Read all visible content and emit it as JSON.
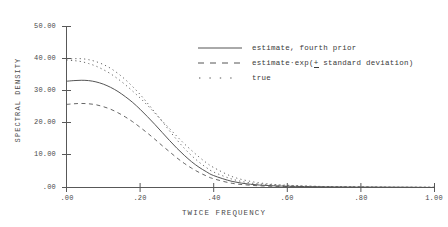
{
  "chart_data": {
    "type": "line",
    "title": "",
    "xlabel": "TWICE FREQUENCY",
    "ylabel": "SPECTRAL DENSITY",
    "xlim": [
      0.0,
      1.0
    ],
    "ylim": [
      0.0,
      50.0
    ],
    "xticks": [
      0.0,
      0.2,
      0.4,
      0.6,
      0.8,
      1.0
    ],
    "xtick_labels": [
      ".00",
      ".20",
      ".40",
      ".60",
      ".80",
      "1.00"
    ],
    "yticks": [
      0.0,
      10.0,
      20.0,
      30.0,
      40.0,
      50.0
    ],
    "ytick_labels": [
      ".00",
      "10.00",
      "20.00",
      "30.00",
      "40.00",
      "50.00"
    ],
    "grid": false,
    "legend_position": "upper right",
    "x": [
      0.0,
      0.02,
      0.04,
      0.06,
      0.08,
      0.1,
      0.12,
      0.14,
      0.16,
      0.18,
      0.2,
      0.22,
      0.24,
      0.26,
      0.28,
      0.3,
      0.32,
      0.34,
      0.36,
      0.38,
      0.4,
      0.45,
      0.5,
      0.55,
      0.6,
      0.7,
      0.8,
      0.9,
      1.0
    ],
    "series": [
      {
        "name": "estimate, fourth prior",
        "style": "solid",
        "values": [
          33.0,
          33.2,
          33.3,
          33.2,
          32.8,
          32.1,
          31.1,
          29.8,
          28.2,
          26.4,
          24.3,
          22.0,
          19.6,
          17.1,
          14.6,
          12.2,
          10.0,
          8.0,
          6.3,
          4.9,
          3.7,
          1.9,
          1.0,
          0.6,
          0.4,
          0.2,
          0.1,
          0.1,
          0.0
        ]
      },
      {
        "name": "estimate-exp(+ standard deviation) upper",
        "style": "dotted",
        "values": [
          39.8,
          40.0,
          40.0,
          39.7,
          39.1,
          38.2,
          37.0,
          35.4,
          33.5,
          31.3,
          28.9,
          26.2,
          23.4,
          20.5,
          17.6,
          14.8,
          12.2,
          9.9,
          7.9,
          6.2,
          4.8,
          2.6,
          1.4,
          0.9,
          0.6,
          0.3,
          0.2,
          0.1,
          0.1
        ]
      },
      {
        "name": "estimate-exp(- standard deviation) lower",
        "style": "dashed",
        "values": [
          25.8,
          26.0,
          26.1,
          26.0,
          25.7,
          25.1,
          24.3,
          23.2,
          21.9,
          20.4,
          18.7,
          16.9,
          15.0,
          13.0,
          11.1,
          9.2,
          7.5,
          6.0,
          4.7,
          3.6,
          2.7,
          1.3,
          0.7,
          0.4,
          0.3,
          0.1,
          0.1,
          0.0,
          0.0
        ]
      },
      {
        "name": "true",
        "style": "dotted",
        "values": [
          39.5,
          39.4,
          39.1,
          38.5,
          37.7,
          36.6,
          35.3,
          33.7,
          31.9,
          29.9,
          27.8,
          25.5,
          23.1,
          20.7,
          18.3,
          15.9,
          13.6,
          11.5,
          9.5,
          7.7,
          6.2,
          3.4,
          1.9,
          1.1,
          0.7,
          0.3,
          0.2,
          0.1,
          0.1
        ]
      }
    ],
    "legend_entries": [
      {
        "label": "estimate, fourth prior",
        "style": "solid"
      },
      {
        "label_prefix": "estimate·exp(",
        "label_pm": "+",
        "label_suffix": " standard deviation)",
        "style": "dashed"
      },
      {
        "label": "true",
        "style": "dotted"
      }
    ],
    "colors": {
      "axis": "#4a4a4a",
      "curve": "#555555",
      "background": "#ffffff"
    }
  }
}
